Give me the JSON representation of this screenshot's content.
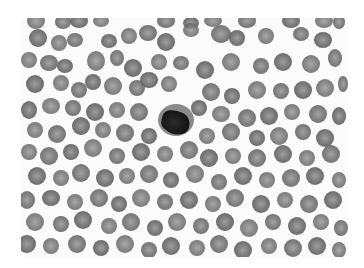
{
  "image": {
    "subject": "blood smear micrograph",
    "mode": "grayscale",
    "frame": {
      "x": 21,
      "y": 18,
      "width": 327,
      "height": 239
    },
    "background_color": "#fbfbfb",
    "colors": {
      "rbc_fill": "#7a7a7a",
      "rbc_dark": "#626262",
      "rbc_center": "#9a9a9a",
      "wbc_fill": "#1e1e1e"
    },
    "leukocyte": {
      "cx": 155,
      "cy": 104,
      "rx": 15,
      "ry": 13
    },
    "cells": [
      [
        15,
        3,
        9,
        8
      ],
      [
        42,
        4,
        8,
        7
      ],
      [
        58,
        3,
        9,
        7
      ],
      [
        80,
        3,
        8,
        6
      ],
      [
        145,
        3,
        9,
        7
      ],
      [
        170,
        5,
        8,
        6
      ],
      [
        192,
        3,
        9,
        6
      ],
      [
        226,
        3,
        9,
        7
      ],
      [
        270,
        3,
        9,
        7
      ],
      [
        303,
        3,
        9,
        7
      ],
      [
        318,
        4,
        6,
        7
      ],
      [
        17,
        20,
        9,
        9
      ],
      [
        38,
        25,
        8,
        8
      ],
      [
        54,
        22,
        8,
        7
      ],
      [
        88,
        23,
        8,
        7
      ],
      [
        108,
        18,
        8,
        8
      ],
      [
        127,
        15,
        9,
        8
      ],
      [
        145,
        24,
        9,
        9
      ],
      [
        170,
        12,
        8,
        7
      ],
      [
        200,
        16,
        10,
        9
      ],
      [
        216,
        20,
        8,
        8
      ],
      [
        245,
        18,
        8,
        8
      ],
      [
        280,
        16,
        8,
        7
      ],
      [
        302,
        22,
        9,
        8
      ],
      [
        8,
        42,
        8,
        8
      ],
      [
        28,
        45,
        9,
        8
      ],
      [
        44,
        48,
        8,
        7
      ],
      [
        75,
        43,
        9,
        10
      ],
      [
        96,
        40,
        7,
        8
      ],
      [
        112,
        50,
        9,
        9
      ],
      [
        138,
        44,
        8,
        8
      ],
      [
        160,
        45,
        8,
        7
      ],
      [
        184,
        52,
        9,
        9
      ],
      [
        210,
        44,
        9,
        9
      ],
      [
        240,
        48,
        8,
        8
      ],
      [
        262,
        44,
        9,
        9
      ],
      [
        290,
        46,
        9,
        9
      ],
      [
        314,
        40,
        7,
        9
      ],
      [
        14,
        66,
        9,
        9
      ],
      [
        40,
        65,
        8,
        8
      ],
      [
        58,
        72,
        8,
        8
      ],
      [
        72,
        64,
        8,
        8
      ],
      [
        92,
        68,
        9,
        9
      ],
      [
        116,
        70,
        8,
        8
      ],
      [
        128,
        62,
        9,
        8
      ],
      [
        148,
        66,
        8,
        8
      ],
      [
        190,
        74,
        9,
        9
      ],
      [
        211,
        78,
        8,
        8
      ],
      [
        236,
        72,
        9,
        9
      ],
      [
        260,
        73,
        8,
        8
      ],
      [
        282,
        72,
        9,
        9
      ],
      [
        304,
        70,
        9,
        9
      ],
      [
        322,
        66,
        5,
        8
      ],
      [
        8,
        92,
        8,
        9
      ],
      [
        30,
        88,
        9,
        8
      ],
      [
        52,
        90,
        8,
        8
      ],
      [
        74,
        94,
        9,
        9
      ],
      [
        96,
        92,
        8,
        8
      ],
      [
        118,
        94,
        9,
        9
      ],
      [
        178,
        90,
        8,
        8
      ],
      [
        200,
        96,
        9,
        8
      ],
      [
        226,
        100,
        9,
        9
      ],
      [
        248,
        98,
        9,
        9
      ],
      [
        271,
        94,
        8,
        8
      ],
      [
        297,
        96,
        9,
        9
      ],
      [
        318,
        98,
        7,
        9
      ],
      [
        14,
        112,
        8,
        8
      ],
      [
        36,
        116,
        9,
        9
      ],
      [
        60,
        108,
        9,
        9
      ],
      [
        82,
        112,
        8,
        8
      ],
      [
        104,
        115,
        9,
        9
      ],
      [
        128,
        118,
        8,
        8
      ],
      [
        186,
        118,
        8,
        8
      ],
      [
        210,
        114,
        9,
        9
      ],
      [
        236,
        120,
        8,
        8
      ],
      [
        258,
        118,
        9,
        9
      ],
      [
        282,
        114,
        8,
        8
      ],
      [
        304,
        120,
        9,
        9
      ],
      [
        8,
        134,
        8,
        8
      ],
      [
        28,
        138,
        9,
        9
      ],
      [
        50,
        134,
        8,
        8
      ],
      [
        72,
        130,
        9,
        9
      ],
      [
        96,
        138,
        8,
        8
      ],
      [
        120,
        134,
        9,
        9
      ],
      [
        144,
        136,
        8,
        8
      ],
      [
        168,
        132,
        9,
        9
      ],
      [
        188,
        140,
        9,
        9
      ],
      [
        212,
        138,
        8,
        8
      ],
      [
        236,
        140,
        9,
        9
      ],
      [
        262,
        136,
        9,
        9
      ],
      [
        286,
        140,
        8,
        8
      ],
      [
        310,
        136,
        9,
        9
      ],
      [
        16,
        158,
        9,
        9
      ],
      [
        40,
        160,
        8,
        8
      ],
      [
        60,
        155,
        9,
        9
      ],
      [
        84,
        160,
        9,
        9
      ],
      [
        106,
        158,
        8,
        8
      ],
      [
        128,
        156,
        9,
        9
      ],
      [
        150,
        162,
        8,
        8
      ],
      [
        174,
        156,
        9,
        9
      ],
      [
        198,
        164,
        8,
        8
      ],
      [
        222,
        158,
        9,
        9
      ],
      [
        246,
        162,
        8,
        8
      ],
      [
        270,
        160,
        9,
        9
      ],
      [
        294,
        158,
        9,
        9
      ],
      [
        318,
        162,
        7,
        8
      ],
      [
        6,
        182,
        8,
        9
      ],
      [
        30,
        180,
        9,
        8
      ],
      [
        54,
        184,
        8,
        8
      ],
      [
        78,
        180,
        9,
        9
      ],
      [
        98,
        186,
        8,
        8
      ],
      [
        120,
        180,
        9,
        9
      ],
      [
        144,
        184,
        8,
        8
      ],
      [
        168,
        182,
        9,
        9
      ],
      [
        192,
        186,
        8,
        8
      ],
      [
        214,
        180,
        9,
        9
      ],
      [
        240,
        186,
        9,
        9
      ],
      [
        264,
        182,
        8,
        8
      ],
      [
        288,
        186,
        9,
        9
      ],
      [
        312,
        182,
        9,
        9
      ],
      [
        14,
        204,
        9,
        9
      ],
      [
        40,
        206,
        8,
        8
      ],
      [
        62,
        202,
        9,
        9
      ],
      [
        88,
        208,
        8,
        8
      ],
      [
        110,
        204,
        9,
        9
      ],
      [
        134,
        210,
        8,
        8
      ],
      [
        156,
        204,
        9,
        9
      ],
      [
        180,
        208,
        8,
        8
      ],
      [
        204,
        204,
        9,
        9
      ],
      [
        228,
        210,
        9,
        9
      ],
      [
        252,
        204,
        8,
        8
      ],
      [
        276,
        208,
        9,
        9
      ],
      [
        300,
        204,
        8,
        8
      ],
      [
        320,
        210,
        7,
        8
      ],
      [
        6,
        226,
        9,
        9
      ],
      [
        30,
        228,
        8,
        8
      ],
      [
        56,
        226,
        9,
        9
      ],
      [
        80,
        230,
        8,
        8
      ],
      [
        104,
        226,
        9,
        9
      ],
      [
        128,
        232,
        8,
        8
      ],
      [
        150,
        228,
        9,
        9
      ],
      [
        176,
        230,
        8,
        8
      ],
      [
        198,
        226,
        9,
        9
      ],
      [
        222,
        232,
        9,
        9
      ],
      [
        248,
        228,
        8,
        8
      ],
      [
        272,
        230,
        9,
        9
      ],
      [
        296,
        228,
        9,
        9
      ],
      [
        318,
        232,
        7,
        8
      ]
    ]
  }
}
